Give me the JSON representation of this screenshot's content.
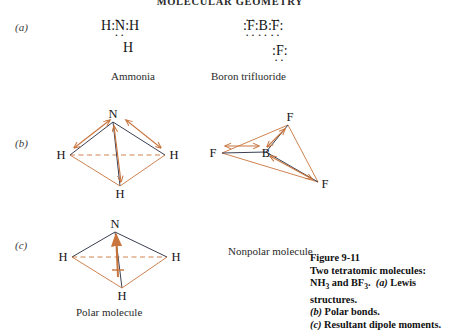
{
  "running_head": "MOLECULAR GEOMETRY",
  "colors": {
    "bond": "#3a3f52",
    "dipole": "#c8743c",
    "dashed_axis": "#c8743c",
    "text": "#141414"
  },
  "panels": [
    {
      "id": "a",
      "label": "(a)"
    },
    {
      "id": "b",
      "label": "(b)"
    },
    {
      "id": "c",
      "label": "(c)"
    }
  ],
  "lewis": {
    "ammonia": {
      "caption": "Ammonia",
      "line1": {
        "h_left": "H",
        "colon_left": ":",
        "center": "N",
        "colon_right": ":",
        "h_right": "H"
      },
      "center_dots_above": "··",
      "center_dots_below": "··",
      "line2": {
        "h_bottom": "H"
      }
    },
    "boron_trifluoride": {
      "caption": "Boron trifluoride",
      "line1": {
        "colon_far_left": ":",
        "f_left": "F",
        "colon_mid_left": ":",
        "b_center": "B",
        "colon_mid_right": ":",
        "f_right": "F",
        "colon_far_right": ":"
      },
      "f_left_dots_above": "··",
      "f_left_dots_below": "··",
      "b_dots_below": "··",
      "f_right_dots_above": "··",
      "f_right_dots_below": "··",
      "line2": {
        "colon_left": ":",
        "f_bottom": "F",
        "colon_right": ":"
      },
      "f_bottom_dots_above": "··",
      "f_bottom_dots_below": "··"
    }
  },
  "structures": {
    "ammonia_bonds": {
      "atoms": {
        "center_top": "N",
        "left": "H",
        "right": "H",
        "front": "H"
      },
      "dipole_count": 3,
      "dipole_direction": "toward-nitrogen"
    },
    "boron_bonds": {
      "atoms": {
        "center": "B",
        "top_right": "F",
        "bottom_right": "F",
        "left": "F"
      },
      "dipole_count": 3,
      "dipole_direction": "toward-fluorine"
    },
    "ammonia_resultant": {
      "atoms": {
        "center_top": "N",
        "left": "H",
        "right": "H",
        "front": "H"
      },
      "resultant_label": "",
      "resultant_direction": "up-toward-nitrogen"
    }
  },
  "molecule_captions": {
    "polar": "Polar molecule",
    "nonpolar": "Nonpolar molecule"
  },
  "figure_caption": {
    "number": "Figure 9-11",
    "line_a": "Two tetratomic molecules:",
    "line_b_pre": "NH",
    "line_b_sub1": "3",
    "line_b_mid": " and BF",
    "line_b_sub2": "3",
    "line_b_post": ".",
    "tag_a": "(a)",
    "text_a": " Lewis structures.",
    "tag_b": "(b)",
    "text_b": " Polar bonds.",
    "tag_c": "(c)",
    "text_c": " Resultant dipole moments."
  }
}
